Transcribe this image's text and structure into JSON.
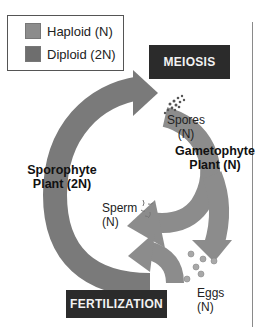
{
  "legend": {
    "items": [
      {
        "label": "Haploid (N)",
        "color": "#8c8c8c"
      },
      {
        "label": "Diploid (2N)",
        "color": "#6e6e6e"
      }
    ]
  },
  "stages": {
    "meiosis": "MEIOSIS",
    "fertilization": "FERTILIZATION"
  },
  "labels": {
    "spores": "Spores",
    "spores_ploidy": "(N)",
    "gametophyte_line1": "Gametophyte",
    "gametophyte_line2": "Plant (N)",
    "sporophyte_line1": "Sporophyte",
    "sporophyte_line2": "Plant (2N)",
    "sperm": "Sperm",
    "sperm_ploidy": "(N)",
    "eggs": "Eggs",
    "eggs_ploidy": "(N)"
  },
  "colors": {
    "haploid_arrow": "#8c8c8c",
    "diploid_arrow": "#7a7a7a",
    "stage_box": "#2b2b2b"
  }
}
